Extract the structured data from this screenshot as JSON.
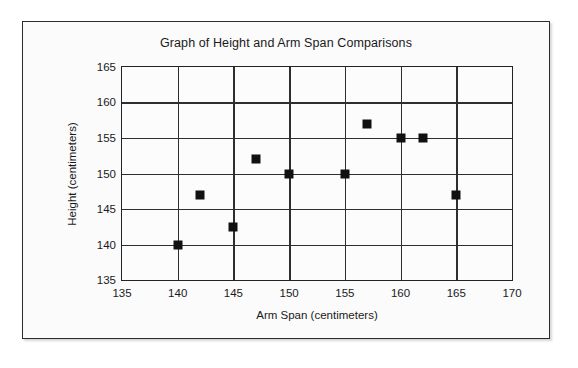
{
  "chart_data": {
    "type": "scatter",
    "title": "Graph of Height and Arm Span Comparisons",
    "xlabel": "Arm Span (centimeters)",
    "ylabel": "Height (centimeters)",
    "xlim": [
      135,
      170
    ],
    "ylim": [
      135,
      165
    ],
    "xticks": [
      135,
      140,
      145,
      150,
      155,
      160,
      165,
      170
    ],
    "yticks": [
      135,
      140,
      145,
      150,
      155,
      160,
      165
    ],
    "xtick_labels": [
      "135",
      "140",
      "145",
      "150",
      "155",
      "160",
      "165",
      "170"
    ],
    "ytick_labels": [
      "135",
      "140",
      "145",
      "150",
      "155",
      "160",
      "165"
    ],
    "grid": true,
    "legend": null,
    "marker": "square",
    "marker_color": "#111111",
    "points": [
      {
        "x": 140,
        "y": 140
      },
      {
        "x": 142,
        "y": 147
      },
      {
        "x": 145,
        "y": 142.5
      },
      {
        "x": 147,
        "y": 152
      },
      {
        "x": 150,
        "y": 150
      },
      {
        "x": 155,
        "y": 150
      },
      {
        "x": 157,
        "y": 157
      },
      {
        "x": 160,
        "y": 155
      },
      {
        "x": 162,
        "y": 155
      },
      {
        "x": 165,
        "y": 147
      }
    ]
  },
  "colors": {
    "frame_border": "#2b2b2b",
    "axis": "#232323",
    "grid": "#2e2e2e",
    "text": "#1a1a1a",
    "background": "#fbfbfb"
  }
}
